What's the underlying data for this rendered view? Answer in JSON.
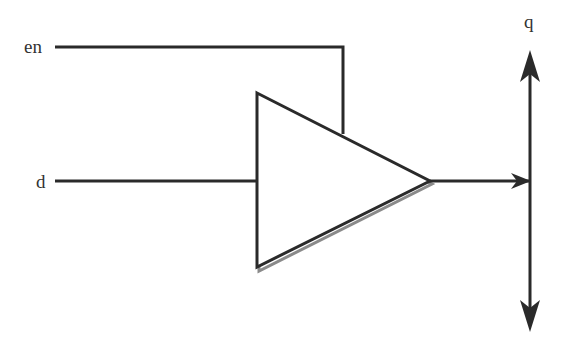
{
  "diagram": {
    "type": "tri-state buffer schematic",
    "colors": {
      "stroke": "#2a2a2a",
      "shadow": "#8a8a8a",
      "background": "#ffffff",
      "text": "#333333"
    },
    "inputs": [
      {
        "id": "enable",
        "label": "en"
      },
      {
        "id": "data",
        "label": "d"
      }
    ],
    "outputs": [
      {
        "id": "bus",
        "label": "q"
      }
    ],
    "component": {
      "name": "buffer",
      "shape": "triangle"
    },
    "connections": [
      {
        "from": "en",
        "to": "buffer-top-edge"
      },
      {
        "from": "d",
        "to": "buffer-input"
      },
      {
        "from": "buffer-output",
        "to": "q-bus"
      }
    ]
  }
}
